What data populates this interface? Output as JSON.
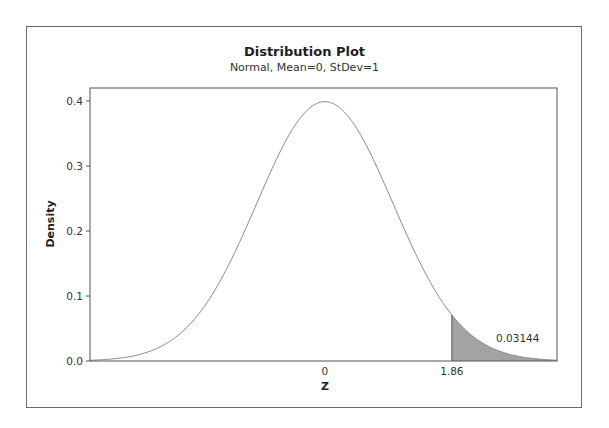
{
  "chart_data": {
    "type": "area",
    "title": "Distribution Plot",
    "subtitle": "Normal, Mean=0, StDev=1",
    "distribution": "Normal",
    "mean": 0,
    "stdev": 1,
    "xlabel": "Z",
    "ylabel": "Density",
    "xlim": [
      -3.44,
      3.4
    ],
    "ylim": [
      0.0,
      0.42
    ],
    "y_ticks": [
      0.0,
      0.1,
      0.2,
      0.3,
      0.4
    ],
    "y_tick_labels": [
      "0.0",
      "0.1",
      "0.2",
      "0.3",
      "0.4"
    ],
    "x_ticks": [
      0,
      1.86
    ],
    "x_tick_labels": [
      "0",
      "1.86"
    ],
    "shaded_region": {
      "from": 1.86,
      "to": 3.4,
      "area": 0.03144,
      "label": "0.03144",
      "color": "#a3a3a3"
    },
    "peak_density": 0.3989,
    "grid": false,
    "line_color": "#8a8a8a"
  }
}
